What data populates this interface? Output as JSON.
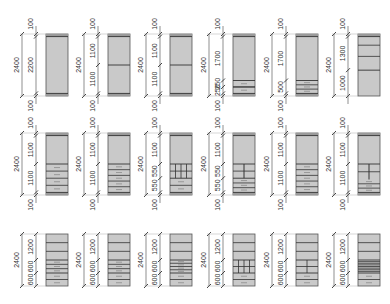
{
  "diagram": {
    "title": "",
    "colors": {
      "panel_fill": "#c9c9c9",
      "panel_stroke": "#555555",
      "shelf_stroke": "#333333",
      "plinth_fill": "#9a9a9a",
      "dim_line": "#444444",
      "text": "#333333"
    },
    "rows": [
      {
        "units": [
          {
            "id": "r1c1",
            "total": "2400",
            "segments": [
              "100",
              "2200",
              "100"
            ],
            "interior": "plain"
          },
          {
            "id": "r1c2",
            "total": "2400",
            "segments": [
              "100",
              "1100",
              "1100",
              "100"
            ],
            "interior": "one-shelf"
          },
          {
            "id": "r1c3",
            "total": "2400",
            "segments": [
              "100",
              "1100",
              "1100",
              "100"
            ],
            "interior": "one-shelf"
          },
          {
            "id": "r1c4",
            "total": "2400",
            "segments": [
              "100",
              "1700",
              "250",
              "250",
              "100"
            ],
            "interior": "two-drawers"
          },
          {
            "id": "r1c5",
            "total": "2400",
            "segments": [
              "100",
              "1700",
              "500",
              "100"
            ],
            "interior": "three-drawers"
          },
          {
            "id": "r1c6",
            "total": "2400",
            "segments": [
              "100",
              "1300",
              "1000"
            ],
            "interior": "shelves-top"
          }
        ]
      },
      {
        "units": [
          {
            "id": "r2c1",
            "total": "2400",
            "segments": [
              "100",
              "1100",
              "1100",
              "100"
            ],
            "interior": "drawers-4"
          },
          {
            "id": "r2c2",
            "total": "2400",
            "segments": [
              "100",
              "1100",
              "1100",
              "100"
            ],
            "interior": "drawers-5"
          },
          {
            "id": "r2c3",
            "total": "2400",
            "segments": [
              "100",
              "1100",
              "550",
              "550",
              "100"
            ],
            "interior": "grid-cubbies"
          },
          {
            "id": "r2c4",
            "total": "2400",
            "segments": [
              "100",
              "1100",
              "550",
              "550",
              "100"
            ],
            "interior": "split-drawers"
          },
          {
            "id": "r2c5",
            "total": "2400",
            "segments": [
              "100",
              "1100",
              "1100",
              "100"
            ],
            "interior": "drawers-5"
          },
          {
            "id": "r2c6",
            "total": "2400",
            "segments": [
              "100",
              "1100",
              "1100",
              "100"
            ],
            "interior": "split-drawers-b"
          }
        ]
      },
      {
        "units": [
          {
            "id": "r3c1",
            "total": "2400",
            "segments": [
              "1200",
              "600",
              "600"
            ],
            "interior": "shelves-drawers"
          },
          {
            "id": "r3c2",
            "total": "2400",
            "segments": [
              "1200",
              "600",
              "600"
            ],
            "interior": "shelves-drawers"
          },
          {
            "id": "r3c3",
            "total": "2400",
            "segments": [
              "1200",
              "600",
              "600"
            ],
            "interior": "shelves-many-drawers"
          },
          {
            "id": "r3c4",
            "total": "2400",
            "segments": [
              "1200",
              "600",
              "600"
            ],
            "interior": "shelves-grid"
          },
          {
            "id": "r3c5",
            "total": "2400",
            "segments": [
              "1200",
              "600",
              "600"
            ],
            "interior": "shelves-split"
          },
          {
            "id": "r3c6",
            "total": "2400",
            "segments": [
              "1200",
              "600",
              "600"
            ],
            "interior": "shelves-stack"
          }
        ]
      }
    ]
  }
}
